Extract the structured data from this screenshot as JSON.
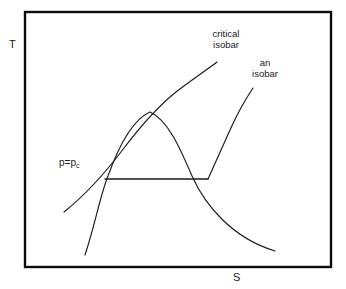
{
  "figure": {
    "type": "diagram",
    "axes": {
      "y_label": "T",
      "x_label": "S"
    },
    "labels": {
      "critical_isobar_line1": "critical",
      "critical_isobar_line2": "isobar",
      "an_isobar_line1": "an",
      "an_isobar_line2": "isobar",
      "p_equals_pc_main": "p=p",
      "p_equals_pc_sub": "c"
    },
    "colors": {
      "ink": "#1a1a1a",
      "border": "#000000",
      "background": "#ffffff"
    },
    "border_box": {
      "x": 25,
      "y": 12,
      "width": 306,
      "height": 255
    },
    "curves": {
      "vapor_dome": "M85,255 C95,225 100,196 108,176 C118,148 132,120 150,112 C168,120 180,148 192,176 C205,205 232,238 275,251",
      "critical_isobar": "M64,212 C84,196 106,172 124,148 C140,127 156,108 176,92 C194,78 208,69 217,62",
      "an_isobar": "M208,179 C214,166 222,148 230,130 C238,112 247,97 253,88",
      "tie_line": "M105,179 L208,179"
    }
  }
}
